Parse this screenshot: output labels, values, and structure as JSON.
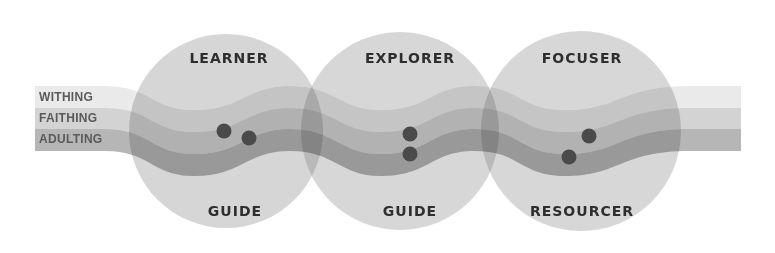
{
  "diagram": {
    "stages": [
      {
        "label": "WITHING",
        "color": "#d9d9d9"
      },
      {
        "label": "FAITHING",
        "color": "#c4c4c4"
      },
      {
        "label": "ADULTING",
        "color": "#aeaeae"
      }
    ],
    "circles": [
      {
        "top_label": "LEARNER",
        "bottom_label": "TEACHER",
        "color": "#cfcfcf"
      },
      {
        "top_label": "EXPLORER",
        "bottom_label": "GUIDE",
        "color": "#cfcfcf"
      },
      {
        "top_label": "FOCUSER",
        "bottom_label": "RESOURCER",
        "color": "#cfcfcf"
      }
    ],
    "dot_color": "#4a4a4a"
  }
}
